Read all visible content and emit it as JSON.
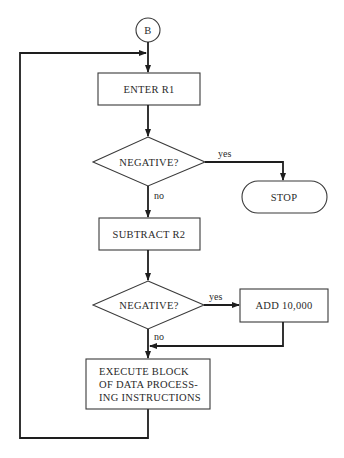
{
  "connector": {
    "label": "B"
  },
  "nodes": {
    "enter": {
      "label": "ENTER R1"
    },
    "decision1": {
      "label": "NEGATIVE?"
    },
    "stop": {
      "label": "STOP"
    },
    "subtract": {
      "label": "SUBTRACT R2"
    },
    "decision2": {
      "label": "NEGATIVE?"
    },
    "add": {
      "label": "ADD 10,000"
    },
    "execute": {
      "lines": [
        "EXECUTE BLOCK",
        "OF DATA PROCESS-",
        "ING INSTRUCTIONS"
      ]
    }
  },
  "edges": {
    "d1_yes": "yes",
    "d1_no": "no",
    "d2_yes": "yes",
    "d2_no": "no"
  },
  "colors": {
    "line": "#1e1e1e",
    "text": "#2a2a2a",
    "background": "#ffffff"
  }
}
